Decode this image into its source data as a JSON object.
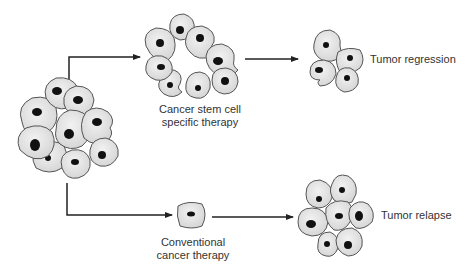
{
  "diagram": {
    "colors": {
      "cell_fill": "#e6e6e6",
      "cell_stroke": "#555555",
      "nucleus": "#111111",
      "arrow": "#222222",
      "text": "#333333"
    },
    "nodes": {
      "initial_tumor": {
        "label": "Tumor (mixed cells)"
      },
      "csc_therapy": {
        "label_line1": "Cancer stem cell",
        "label_line2": "specific therapy"
      },
      "regression": {
        "label": "Tumor regression"
      },
      "conventional": {
        "label_line1": "Conventional",
        "label_line2": "cancer therapy"
      },
      "relapse": {
        "label": "Tumor relapse"
      }
    },
    "edges": [
      {
        "from": "initial_tumor",
        "to": "csc_therapy"
      },
      {
        "from": "csc_therapy",
        "to": "regression"
      },
      {
        "from": "initial_tumor",
        "to": "conventional"
      },
      {
        "from": "conventional",
        "to": "relapse"
      }
    ]
  }
}
